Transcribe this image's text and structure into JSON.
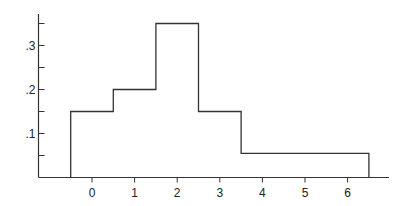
{
  "chart_data": {
    "type": "bar",
    "subtype": "step-histogram",
    "title": "",
    "xlabel": "",
    "ylabel": "",
    "bins": [
      {
        "x0": -0.5,
        "x1": 0.5,
        "value": 0.15
      },
      {
        "x0": 0.5,
        "x1": 1.5,
        "value": 0.2
      },
      {
        "x0": 1.5,
        "x1": 2.5,
        "value": 0.35
      },
      {
        "x0": 2.5,
        "x1": 3.5,
        "value": 0.15
      },
      {
        "x0": 3.5,
        "x1": 6.5,
        "value": 0.055
      }
    ],
    "categories": [
      "0",
      "1",
      "2",
      "3",
      "4-6"
    ],
    "values": [
      0.15,
      0.2,
      0.35,
      0.15,
      0.055
    ],
    "x_ticks": [
      0,
      1,
      2,
      3,
      4,
      5,
      6
    ],
    "x_tick_labels": [
      "0",
      "1",
      "2",
      "3",
      "4",
      "5",
      "6"
    ],
    "y_ticks": [
      0.05,
      0.1,
      0.15,
      0.2,
      0.25,
      0.3,
      0.35
    ],
    "y_tick_labels": [
      ".1",
      ".2",
      ".3"
    ],
    "y_labeled_ticks": [
      0.1,
      0.2,
      0.3
    ],
    "xlim": [
      -1.2,
      7.0
    ],
    "ylim": [
      0,
      0.36
    ],
    "grid": false,
    "legend": null
  },
  "style": {
    "line_color": "#333333",
    "axis_color": "#333333"
  }
}
